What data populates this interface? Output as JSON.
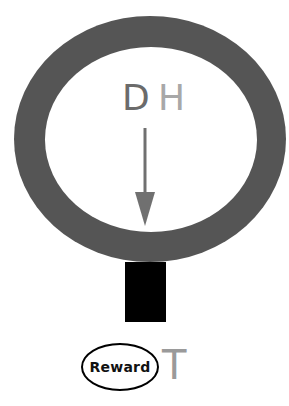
{
  "diagram": {
    "ring": {
      "color": "#555555"
    },
    "labels": {
      "d": {
        "text": "D",
        "color": "#6b6b6b"
      },
      "h": {
        "text": "H",
        "color": "#a8a8a8"
      },
      "t": {
        "text": "T",
        "color": "#9a9a9a"
      }
    },
    "arrow": {
      "direction": "down",
      "color": "#707070"
    },
    "stem": {
      "color": "#000000"
    },
    "reward_node": {
      "text": "Reward"
    }
  }
}
